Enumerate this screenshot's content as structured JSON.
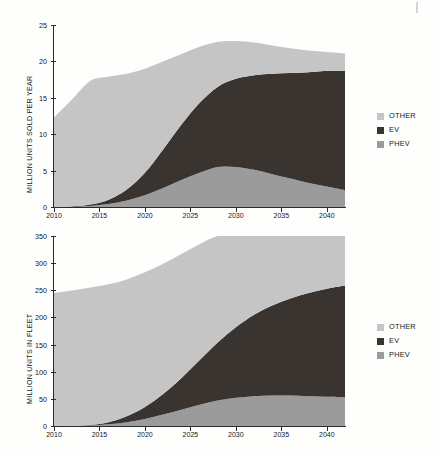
{
  "figure": {
    "kind": "two-stacked-area-charts",
    "background": "#fefefd"
  },
  "colors": {
    "other": "#c5c5c5",
    "ev": "#3a3430",
    "phev": "#9b9b9b",
    "axis": "#2b2b2f",
    "text": "#15151a"
  },
  "legend": {
    "items": [
      {
        "label": "OTHER",
        "color": "#c5c5c5"
      },
      {
        "label": "EV",
        "color": "#3a3430"
      },
      {
        "label": "PHEV",
        "color": "#9b9b9b"
      }
    ]
  },
  "chart_data": [
    {
      "type": "area",
      "id": "units-sold-per-year",
      "title": "",
      "xlabel": "",
      "ylabel": "MILLION UNITS SOLD PER YEAR",
      "stacked": true,
      "grid": false,
      "legend_position": "right",
      "xlim": [
        2010,
        2042
      ],
      "ylim": [
        0,
        25
      ],
      "yticks": [
        0,
        5,
        10,
        15,
        20,
        25
      ],
      "xticks": [
        2010,
        2015,
        2020,
        2025,
        2030,
        2035,
        2040
      ],
      "x": [
        2010,
        2012,
        2014,
        2016,
        2018,
        2020,
        2022,
        2024,
        2026,
        2028,
        2030,
        2032,
        2034,
        2036,
        2038,
        2040,
        2042
      ],
      "series": [
        {
          "name": "PHEV",
          "values": [
            0.0,
            0.05,
            0.15,
            0.4,
            0.9,
            1.6,
            2.6,
            3.7,
            4.7,
            5.5,
            5.5,
            5.1,
            4.5,
            3.9,
            3.3,
            2.8,
            2.3
          ]
        },
        {
          "name": "EV",
          "values": [
            0.0,
            0.05,
            0.2,
            0.6,
            1.5,
            3.1,
            5.3,
            7.6,
            9.6,
            11.0,
            12.1,
            13.0,
            13.8,
            14.5,
            15.2,
            15.9,
            16.4
          ]
        },
        {
          "name": "OTHER",
          "values": [
            12.3,
            14.7,
            17.0,
            16.9,
            15.9,
            14.3,
            12.1,
            9.7,
            7.7,
            6.2,
            5.2,
            4.5,
            3.9,
            3.4,
            3.0,
            2.6,
            2.4
          ]
        }
      ],
      "totals": [
        12.3,
        14.8,
        17.2,
        17.5,
        17.8,
        18.2,
        18.6,
        18.9,
        19.1,
        19.3,
        19.4,
        19.5,
        19.6,
        19.7,
        19.7,
        19.8,
        19.8
      ]
    },
    {
      "type": "area",
      "id": "units-in-fleet",
      "title": "",
      "xlabel": "",
      "ylabel": "MILLION UNITS IN FLEET",
      "stacked": true,
      "grid": false,
      "legend_position": "right",
      "xlim": [
        2010,
        2042
      ],
      "ylim": [
        0,
        350
      ],
      "yticks": [
        0,
        50,
        100,
        150,
        200,
        250,
        300,
        350
      ],
      "xticks": [
        2010,
        2015,
        2020,
        2025,
        2030,
        2035,
        2040
      ],
      "x": [
        2010,
        2012,
        2014,
        2016,
        2018,
        2020,
        2022,
        2024,
        2026,
        2028,
        2030,
        2032,
        2034,
        2036,
        2038,
        2040,
        2042
      ],
      "series": [
        {
          "name": "PHEV",
          "values": [
            0,
            0.3,
            1,
            3,
            7,
            13,
            21,
            30,
            39,
            47,
            52,
            55,
            56,
            56,
            55,
            54,
            53
          ]
        },
        {
          "name": "EV",
          "values": [
            0,
            0.2,
            1,
            4,
            11,
            22,
            38,
            58,
            82,
            107,
            130,
            150,
            166,
            179,
            190,
            199,
            206
          ]
        },
        {
          "name": "OTHER",
          "values": [
            245,
            249,
            253,
            254,
            252,
            248,
            240,
            229,
            214,
            197,
            180,
            163,
            148,
            136,
            125,
            116,
            109
          ]
        }
      ],
      "totals": [
        245,
        249.5,
        255,
        261,
        270,
        283,
        299,
        317,
        335,
        351,
        362,
        368,
        370,
        371,
        370,
        369,
        368
      ],
      "note": "series clipped by axis maximum at 350"
    }
  ]
}
